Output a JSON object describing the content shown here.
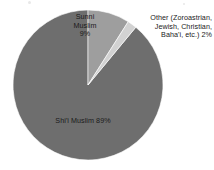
{
  "chart_data": {
    "type": "pie",
    "title": "",
    "subtitle": "",
    "xlabel": "",
    "ylabel": "",
    "legend_position": "none",
    "grid": false,
    "total_label": "100%",
    "categories": [
      "Shi'i Muslim",
      "Sunni Muslim",
      "Other (Zoroastrian, Jewish, Christian, Baha'i, etc.)"
    ],
    "values": [
      89,
      9,
      2
    ],
    "units": "percent",
    "start_angle_deg": 0,
    "direction": "clockwise",
    "slices": [
      {
        "name": "sunni",
        "label": "Sunni\nMuslim\n9%",
        "category": "Sunni Muslim",
        "value": 9,
        "value_label": "9%",
        "color": "#9e9e9e",
        "start_deg": 0,
        "end_deg": 32.4
      },
      {
        "name": "other",
        "label": "Other (Zoroastrian,\nJewish, Christian,\nBaha'i, etc.) 2%",
        "category": "Other (Zoroastrian, Jewish, Christian, Baha'i, etc.)",
        "value": 2,
        "value_label": "2%",
        "color": "#d2d2d2",
        "start_deg": 32.4,
        "end_deg": 39.6
      },
      {
        "name": "shii",
        "label": "Shi'i Muslim 89%",
        "category": "Shi'i Muslim",
        "value": 89,
        "value_label": "89%",
        "color": "#6e6e6e",
        "start_deg": 39.6,
        "end_deg": 360
      }
    ]
  },
  "labels": {
    "sunni": "Sunni\nMuslim\n9%",
    "other": "Other (Zoroastrian,\nJewish, Christian,\nBaha'i, etc.) 2%",
    "shii": "Shi'i Muslim 89%"
  },
  "colors": {
    "background": "#ffffff",
    "slice_shii": "#6e6e6e",
    "slice_sunni": "#9e9e9e",
    "slice_other": "#d2d2d2",
    "slice_outline": "#ffffff",
    "text": "#1a1a1a"
  }
}
